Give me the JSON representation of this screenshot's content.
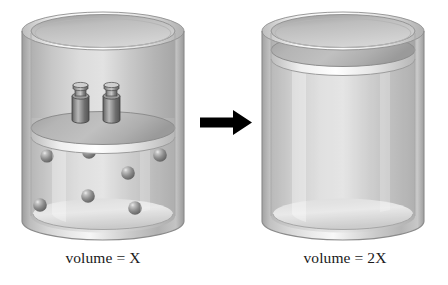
{
  "figure": {
    "background_color": "#ffffff",
    "width": 448,
    "height": 285
  },
  "captions": {
    "left": "volume = X",
    "right": "volume = 2X"
  },
  "arrow": {
    "name": "right-arrow",
    "color": "#000000",
    "direction": "right",
    "x": 200,
    "y": 122,
    "length": 50
  },
  "cylinders": [
    {
      "id": "left",
      "name": "cylinder-with-weights",
      "x": 22,
      "y": 12,
      "width": 162,
      "height": 228,
      "body_color": "#c9c9c9",
      "highlight_color": "#f2f2f2",
      "shadow_color": "#8e8e8e",
      "rim_color": "#e3e3e3",
      "piston": {
        "name": "piston-disc",
        "center_y": 128,
        "thickness": 9,
        "top_color": "#b4b4b4",
        "edge_color": "#e8e8e8"
      },
      "weights": [
        {
          "name": "weight-left",
          "x": 72,
          "y": 86,
          "width": 17,
          "height": 38
        },
        {
          "name": "weight-right",
          "x": 103,
          "y": 86,
          "width": 17,
          "height": 38
        }
      ],
      "particles": [
        {
          "cx": 47,
          "cy": 156,
          "r": 6.5
        },
        {
          "cx": 89,
          "cy": 152,
          "r": 6.8
        },
        {
          "cx": 160,
          "cy": 155,
          "r": 6.8
        },
        {
          "cx": 128,
          "cy": 173,
          "r": 6.8
        },
        {
          "cx": 40,
          "cy": 205,
          "r": 6.8
        },
        {
          "cx": 88,
          "cy": 196,
          "r": 6.8
        },
        {
          "cx": 135,
          "cy": 208,
          "r": 6.8
        },
        {
          "cx": 89,
          "cy": 226,
          "r": 0
        }
      ],
      "particle_count": 8,
      "particle_color": "#6f6f6f"
    },
    {
      "id": "right",
      "name": "cylinder-expanded",
      "x": 262,
      "y": 12,
      "width": 162,
      "height": 228,
      "body_color": "#cfcfcf",
      "highlight_color": "#f5f5f5",
      "shadow_color": "#949494",
      "rim_color": "#e3e3e3",
      "piston": {
        "name": "piston-disc",
        "center_y": 50,
        "thickness": 9,
        "top_color": "#b4b4b4",
        "edge_color": "#eaeaea"
      },
      "weights": [],
      "particles": [],
      "particle_count": 0
    }
  ]
}
